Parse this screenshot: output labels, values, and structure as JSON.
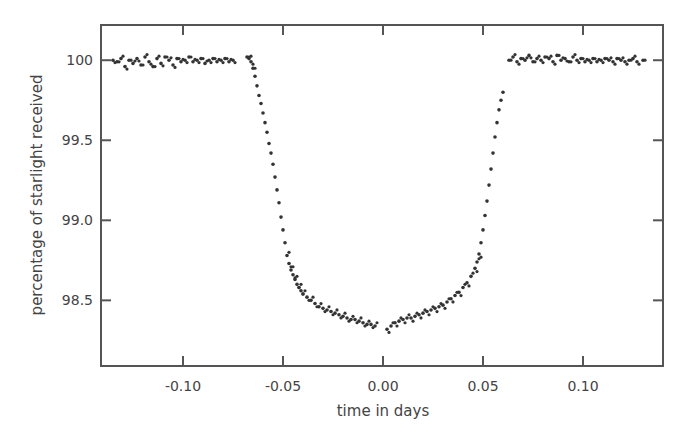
{
  "chart_data": {
    "type": "scatter",
    "title": "",
    "xlabel": "time in days",
    "ylabel": "percentage of starlight received",
    "xlim": [
      -0.141,
      0.14
    ],
    "ylim": [
      98.09,
      100.22
    ],
    "xticks": [
      -0.1,
      -0.05,
      0.0,
      0.05,
      0.1
    ],
    "xtick_labels": [
      "-0.10",
      "-0.05",
      "0.00",
      "0.05",
      "0.10"
    ],
    "yticks": [
      98.5,
      99.0,
      99.5,
      100
    ],
    "ytick_labels": [
      "98.5",
      "99.0",
      "99.5",
      "100"
    ],
    "grid": false,
    "legend": null,
    "point_color": "#333333",
    "series": [
      {
        "name": "transit light curve",
        "x": [
          -0.135,
          -0.133,
          -0.131,
          -0.129,
          -0.127,
          -0.125,
          -0.123,
          -0.121,
          -0.119,
          -0.117,
          -0.115,
          -0.113,
          -0.111,
          -0.109,
          -0.107,
          -0.105,
          -0.103,
          -0.101,
          -0.099,
          -0.097,
          -0.095,
          -0.093,
          -0.091,
          -0.089,
          -0.087,
          -0.085,
          -0.083,
          -0.081,
          -0.079,
          -0.077,
          -0.075,
          -0.068,
          -0.067,
          -0.066,
          -0.065,
          -0.064,
          -0.063,
          -0.062,
          -0.061,
          -0.06,
          -0.059,
          -0.058,
          -0.057,
          -0.056,
          -0.055,
          -0.054,
          -0.053,
          -0.052,
          -0.051,
          -0.05,
          -0.049,
          -0.048,
          -0.047,
          -0.046,
          -0.045,
          -0.044,
          -0.043,
          -0.042,
          -0.041,
          -0.04,
          -0.038,
          -0.036,
          -0.034,
          -0.032,
          -0.03,
          -0.028,
          -0.026,
          -0.024,
          -0.022,
          -0.02,
          -0.018,
          -0.016,
          -0.014,
          -0.012,
          -0.01,
          -0.008,
          -0.006,
          -0.004,
          0.002,
          0.004,
          0.006,
          0.008,
          0.01,
          0.012,
          0.014,
          0.016,
          0.018,
          0.02,
          0.022,
          0.024,
          0.026,
          0.028,
          0.03,
          0.032,
          0.034,
          0.036,
          0.038,
          0.04,
          0.042,
          0.044,
          0.046,
          0.047,
          0.048,
          0.049,
          0.05,
          0.051,
          0.052,
          0.053,
          0.054,
          0.055,
          0.056,
          0.057,
          0.058,
          0.059,
          0.06,
          0.063,
          0.065,
          0.067,
          0.069,
          0.071,
          0.073,
          0.075,
          0.077,
          0.079,
          0.081,
          0.083,
          0.085,
          0.087,
          0.089,
          0.091,
          0.093,
          0.095,
          0.097,
          0.099,
          0.101,
          0.103,
          0.105,
          0.107,
          0.109,
          0.111,
          0.113,
          0.115,
          0.117,
          0.119,
          0.121,
          0.123,
          0.125,
          0.127,
          0.13
        ],
        "y": [
          100.0,
          99.99,
          100.01,
          99.96,
          100.0,
          99.98,
          100.01,
          99.97,
          100.02,
          99.99,
          99.96,
          100.01,
          99.98,
          100.02,
          100.0,
          99.97,
          100.01,
          99.99,
          100.0,
          100.02,
          99.99,
          100.0,
          100.01,
          99.98,
          100.0,
          100.01,
          99.99,
          100.0,
          100.01,
          99.99,
          100.0,
          100.02,
          100.01,
          99.99,
          99.95,
          99.9,
          99.84,
          99.78,
          99.73,
          99.67,
          99.61,
          99.55,
          99.48,
          99.42,
          99.35,
          99.27,
          99.19,
          99.11,
          99.02,
          98.94,
          98.86,
          98.78,
          98.73,
          98.69,
          98.66,
          98.63,
          98.6,
          98.58,
          98.56,
          98.54,
          98.52,
          98.5,
          98.48,
          98.46,
          98.45,
          98.44,
          98.43,
          98.42,
          98.41,
          98.4,
          98.39,
          98.38,
          98.38,
          98.37,
          98.36,
          98.35,
          98.35,
          98.34,
          98.32,
          98.34,
          98.36,
          98.37,
          98.38,
          98.39,
          98.39,
          98.4,
          98.41,
          98.42,
          98.43,
          98.44,
          98.45,
          98.46,
          98.47,
          98.49,
          98.51,
          98.53,
          98.55,
          98.58,
          98.61,
          98.65,
          98.7,
          98.74,
          98.79,
          98.86,
          98.94,
          99.03,
          99.12,
          99.22,
          99.32,
          99.42,
          99.52,
          99.61,
          99.69,
          99.75,
          99.8,
          100.0,
          100.02,
          99.99,
          100.01,
          100.0,
          100.03,
          99.99,
          100.01,
          100.0,
          100.02,
          100.01,
          99.99,
          100.03,
          100.0,
          100.01,
          99.99,
          100.02,
          100.0,
          100.01,
          99.99,
          100.0,
          100.01,
          99.99,
          100.0,
          100.01,
          100.0,
          99.99,
          100.01,
          100.0,
          99.99,
          100.0,
          100.01,
          99.99,
          100.0
        ]
      }
    ]
  }
}
